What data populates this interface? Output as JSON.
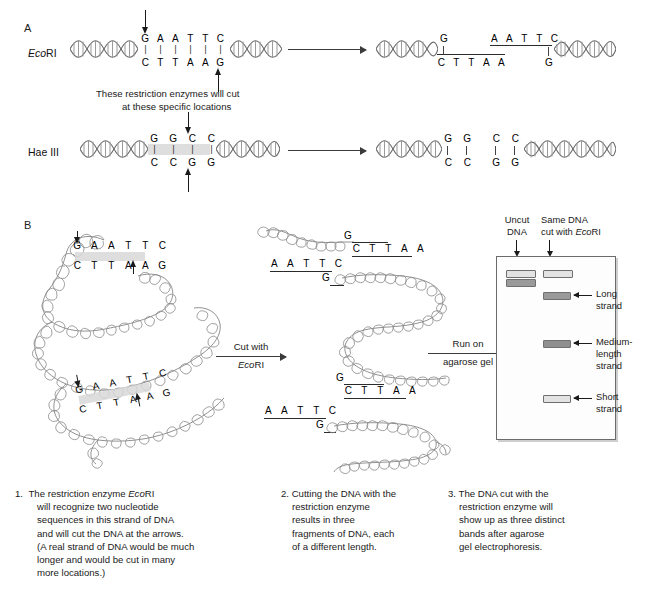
{
  "figure": {
    "panels": [
      {
        "letter": "A"
      },
      {
        "letter": "B"
      }
    ]
  },
  "panel_a": {
    "rows": [
      {
        "enzyme_italic": "Eco",
        "enzyme_roman": "RI",
        "top_sequence": [
          "G",
          "A",
          "A",
          "T",
          "T",
          "C"
        ],
        "bottom_sequence": [
          "C",
          "T",
          "T",
          "A",
          "A",
          "G"
        ],
        "bonds": [
          "|",
          "|",
          "|",
          "|",
          "|",
          "|"
        ],
        "cut_top_after_index": 1,
        "cut_bottom_after_index": 5,
        "products": {
          "left_fragment": {
            "top": "G",
            "bottom": [
              "C",
              "T",
              "T",
              "A",
              "A"
            ]
          },
          "right_fragment": {
            "top": [
              "A",
              "A",
              "T",
              "T",
              "C"
            ],
            "bottom": "G"
          }
        }
      },
      {
        "enzyme_italic": "",
        "enzyme_roman": "Hae III",
        "top_sequence": [
          "G",
          "G",
          "C",
          "C"
        ],
        "bottom_sequence": [
          "C",
          "C",
          "G",
          "G"
        ],
        "bonds": [
          "|",
          "|",
          "|",
          "|"
        ],
        "cut_top_after_index": 2,
        "cut_bottom_after_index": 2,
        "products": {
          "left_fragment": {
            "top": [
              "G",
              "G"
            ],
            "bottom": [
              "C",
              "C"
            ]
          },
          "right_fragment": {
            "top": [
              "C",
              "C"
            ],
            "bottom": [
              "G",
              "G"
            ]
          }
        }
      }
    ],
    "cut_note_line1": "These restriction enzymes will cut",
    "cut_note_line2": "at these specific locations"
  },
  "panel_b": {
    "recognition_sites": [
      {
        "top": [
          "G",
          "A",
          "A",
          "T",
          "T",
          "C"
        ],
        "bottom": [
          "C",
          "T",
          "T",
          "A",
          "A",
          "G"
        ]
      },
      {
        "top": [
          "G",
          "A",
          "A",
          "T",
          "T",
          "C"
        ],
        "bottom": [
          "C",
          "T",
          "T",
          "A",
          "A",
          "G"
        ]
      }
    ],
    "arrows": [
      {
        "line1": "Cut with",
        "line2_italic": "Eco",
        "line2_roman": "RI"
      },
      {
        "line1": "Run on",
        "line2_roman": "agarose gel"
      }
    ],
    "fragments": [
      {
        "end_top": "G",
        "end_bottom": [
          "C",
          "T",
          "T",
          "A",
          "A"
        ]
      },
      {
        "start_top": [
          "A",
          "A",
          "T",
          "T",
          "C"
        ],
        "start_bottom": "G",
        "end_top": "G",
        "end_bottom": [
          "C",
          "T",
          "T",
          "A",
          "A"
        ]
      },
      {
        "start_top": [
          "A",
          "A",
          "T",
          "T",
          "C"
        ],
        "start_bottom": "G"
      }
    ],
    "gel": {
      "lane_labels": [
        {
          "line1": "Uncut",
          "line2": "DNA"
        },
        {
          "line1": "Same DNA",
          "line2_prefix": "cut with ",
          "line2_italic": "Eco",
          "line2_suffix": "RI"
        }
      ],
      "band_labels": [
        {
          "line1": "Long",
          "line2": "strand"
        },
        {
          "line1": "Medium-",
          "line2": "length",
          "line3": "strand"
        },
        {
          "line1": "Short",
          "line2": "strand"
        }
      ]
    }
  },
  "captions": [
    {
      "number": "1.",
      "lines": [
        "The restriction enzyme EcoRI",
        "will recognize two nucleotide",
        "sequences in this strand of DNA",
        "and will cut the DNA at the arrows.",
        "(A real strand of DNA would be much",
        "longer and would be cut in many",
        "more locations.)"
      ],
      "italic_token": "Eco"
    },
    {
      "number": "2.",
      "lines": [
        "Cutting the DNA with the",
        "restriction enzyme",
        "results in three",
        "fragments of DNA, each",
        "of a different length."
      ],
      "italic_token": ""
    },
    {
      "number": "3.",
      "lines": [
        "The DNA cut with the",
        "restriction enzyme will",
        "show up as three distinct",
        "bands after agarose",
        "gel electrophoresis."
      ],
      "italic_token": ""
    }
  ],
  "colors": {
    "ink": "#1a1a1a",
    "helix_dark": "#5a5a5a",
    "helix_light": "#b9b9b9",
    "band_light": "#e3e3e3",
    "band_dark": "#9a9a9a",
    "gel_border": "#6b6b6b",
    "site_highlight": "#d8d8d8"
  }
}
